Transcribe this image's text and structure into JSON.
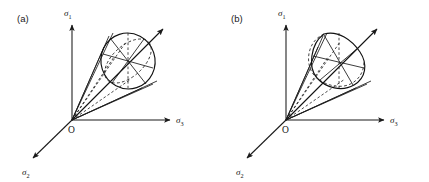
{
  "figure": {
    "background_color": "#ffffff",
    "line_color": "#1a1a1a",
    "width": 429,
    "height": 182
  },
  "panels": [
    {
      "id": "a",
      "label": "(a)",
      "cross_section_type": "circle",
      "cross_section_name": "circular deviatoric section",
      "origin_label": "O",
      "axes": [
        {
          "name": "sigma-1",
          "symbol": "σ",
          "subscript": "1",
          "direction": "up"
        },
        {
          "name": "sigma-2",
          "symbol": "σ",
          "subscript": "2",
          "direction": "down-left"
        },
        {
          "name": "sigma-3",
          "symbol": "σ",
          "subscript": "3",
          "direction": "right"
        }
      ],
      "hydrostatic_axis": {
        "name": "hydrostatic-axis",
        "direction": "up-right",
        "arrow": true
      },
      "spoke_count": 6
    },
    {
      "id": "b",
      "label": "(b)",
      "cross_section_type": "rounded-triangle",
      "cross_section_name": "rounded triangular deviatoric section",
      "origin_label": "O",
      "axes": [
        {
          "name": "sigma-1",
          "symbol": "σ",
          "subscript": "1",
          "direction": "up"
        },
        {
          "name": "sigma-2",
          "symbol": "σ",
          "subscript": "2",
          "direction": "down-left"
        },
        {
          "name": "sigma-3",
          "symbol": "σ",
          "subscript": "3",
          "direction": "right"
        }
      ],
      "hydrostatic_axis": {
        "name": "hydrostatic-axis",
        "direction": "up-right",
        "arrow": true
      },
      "spoke_count": 6
    }
  ]
}
